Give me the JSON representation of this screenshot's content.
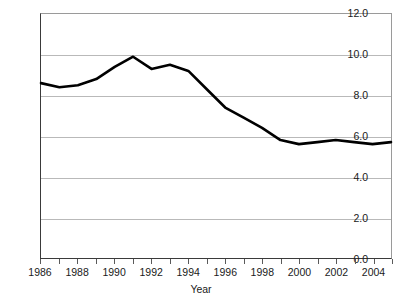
{
  "chart_data": {
    "type": "line",
    "title": "",
    "subtitle": "",
    "xlabel": "Year",
    "ylabel": "",
    "xlim": [
      1986,
      2005
    ],
    "ylim": [
      0.0,
      12.0
    ],
    "grid": "horizontal",
    "legend": "none",
    "y_ticks": [
      "0.0",
      "2.0",
      "4.0",
      "6.0",
      "8.0",
      "10.0",
      "12.0"
    ],
    "y_tick_values": [
      0.0,
      2.0,
      4.0,
      6.0,
      8.0,
      10.0,
      12.0
    ],
    "x_ticks": [
      "1986",
      "1988",
      "1990",
      "1992",
      "1994",
      "1996",
      "1998",
      "2000",
      "2002",
      "2004"
    ],
    "x_tick_values": [
      1986,
      1988,
      1990,
      1992,
      1994,
      1996,
      1998,
      2000,
      2002,
      2004
    ],
    "x_minor_tick_values": [
      1986,
      1987,
      1988,
      1989,
      1990,
      1991,
      1992,
      1993,
      1994,
      1995,
      1996,
      1997,
      1998,
      1999,
      2000,
      2001,
      2002,
      2003,
      2004,
      2005
    ],
    "series": [
      {
        "name": "rate",
        "color": "#000000",
        "x": [
          1986,
          1987,
          1988,
          1989,
          1990,
          1991,
          1992,
          1993,
          1994,
          1995,
          1996,
          1997,
          1998,
          1999,
          2000,
          2001,
          2002,
          2003,
          2004,
          2005
        ],
        "values": [
          8.6,
          8.4,
          8.5,
          8.8,
          9.4,
          9.9,
          9.3,
          9.5,
          9.2,
          8.3,
          7.4,
          6.9,
          6.4,
          5.8,
          5.6,
          5.7,
          5.8,
          5.7,
          5.6,
          5.7
        ]
      }
    ]
  },
  "axes": {
    "y_title": "",
    "x_title": "Year"
  }
}
